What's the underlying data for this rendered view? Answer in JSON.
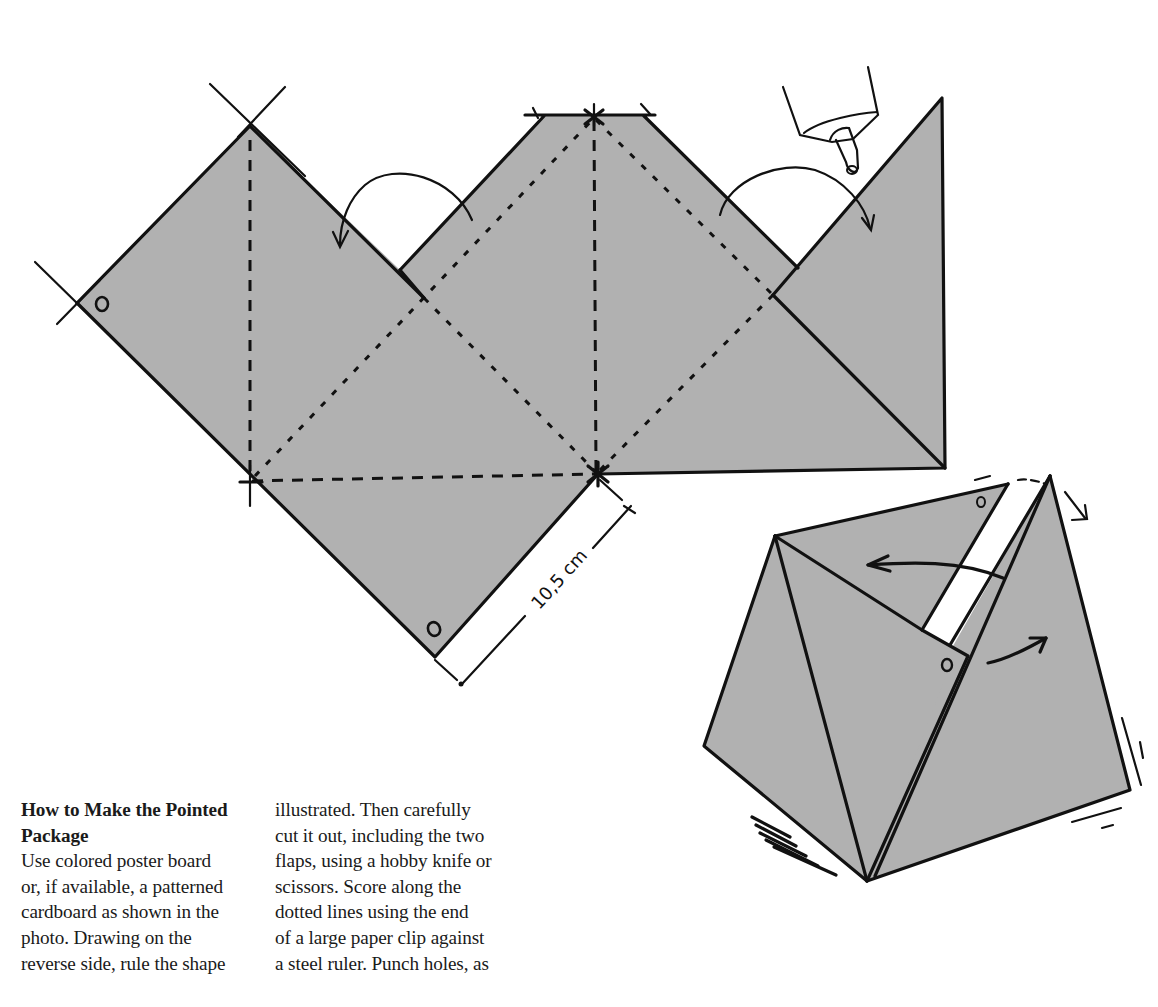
{
  "figure": {
    "fill_color": "#b1b1b1",
    "line_color": "#111111",
    "dimension_label": "10,5 cm",
    "flat_net": {
      "description": "flat pattern with fold lines, two flaps and punch holes",
      "punch_holes": 2,
      "fold_arrows": 2,
      "glue_bottle": true
    },
    "assembled_package": {
      "description": "assembled pointed package with flap being folded in",
      "punch_holes": 2,
      "motion_arrows": 3
    }
  },
  "article": {
    "heading_line1": "How to Make the Pointed",
    "heading_line2": "Package",
    "column1_lines": [
      "Use colored poster board",
      "or, if available, a patterned",
      "cardboard as shown in the",
      "photo. Drawing on the",
      "reverse side, rule the shape"
    ],
    "column2_lines": [
      "illustrated. Then carefully",
      "cut it out, including the two",
      "flaps, using a hobby knife or",
      "scissors. Score along the",
      "dotted lines using the end",
      "of a large paper clip against",
      "a steel ruler. Punch holes, as"
    ]
  }
}
